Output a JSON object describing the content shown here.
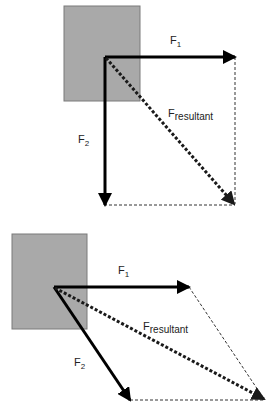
{
  "colors": {
    "box_fill": "#a9a9a9",
    "box_stroke": "#7a7a7a",
    "vector": "#000000",
    "resultant": "#1a1a1a",
    "construction": "#333333"
  },
  "diagrams": [
    {
      "id": "perpendicular",
      "labels": {
        "f1_main": "F",
        "f1_sub": "1",
        "f2_main": "F",
        "f2_sub": "2",
        "fr_main": "F",
        "fr_sub": "resultant"
      }
    },
    {
      "id": "oblique",
      "labels": {
        "f1_main": "F",
        "f1_sub": "1",
        "f2_main": "F",
        "f2_sub": "2",
        "fr_main": "F",
        "fr_sub": "resultant"
      }
    }
  ]
}
